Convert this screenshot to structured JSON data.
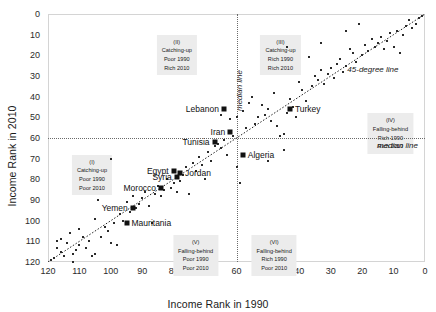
{
  "chart_data": {
    "type": "scatter",
    "title": "",
    "xlabel": "Income Rank in 1990",
    "ylabel": "Income Rank in 2010",
    "xlim": [
      120,
      0
    ],
    "ylim": [
      120,
      0
    ],
    "x_reversed": true,
    "y_reversed": true,
    "xticks": [
      120,
      110,
      100,
      90,
      80,
      70,
      60,
      50,
      40,
      30,
      20,
      10,
      0
    ],
    "yticks": [
      0,
      10,
      20,
      30,
      40,
      50,
      60,
      70,
      80,
      90,
      100,
      110,
      120
    ],
    "grid": false,
    "legend": "none",
    "reference_lines": [
      {
        "name": "45-degree line",
        "kind": "identity",
        "label": "45-degree line",
        "style": "dotted"
      },
      {
        "name": "median line vertical",
        "kind": "vertical",
        "value": 60,
        "label": "median line",
        "style": "dotted"
      },
      {
        "name": "median line horizontal",
        "kind": "horizontal",
        "value": 60,
        "label": "median line",
        "style": "dotted"
      }
    ],
    "quadrants": [
      {
        "id": "I",
        "roman": "(I)",
        "line1": "Catching-up",
        "line2": "Poor 1990",
        "line3": "Poor 2010",
        "x": 106,
        "y": 68
      },
      {
        "id": "II",
        "roman": "(II)",
        "line1": "Catching-up",
        "line2": "Poor 1990",
        "line3": "Rich 2010",
        "x": 79,
        "y": 10
      },
      {
        "id": "III",
        "roman": "(III)",
        "line1": "Catching-up",
        "line2": "Rich 1990",
        "line3": "Rich 2010",
        "x": 46,
        "y": 10
      },
      {
        "id": "IV",
        "roman": "(IV)",
        "line1": "Falling-behind",
        "line2": "Rich 1990",
        "line3": "Rich 2010",
        "x": 11,
        "y": 48
      },
      {
        "id": "V",
        "roman": "(V)",
        "line1": "Falling-behind",
        "line2": "Poor 1990",
        "line3": "Poor 2010",
        "x": 73,
        "y": 107
      },
      {
        "id": "VI",
        "roman": "(VI)",
        "line1": "Falling-behind",
        "line2": "Rich 1990",
        "line3": "Poor 2010",
        "x": 48,
        "y": 107
      }
    ],
    "highlighted": [
      {
        "name": "Lebanon",
        "x": 64,
        "y": 46,
        "label_side": "left"
      },
      {
        "name": "Turkey",
        "x": 43,
        "y": 46,
        "label_side": "right"
      },
      {
        "name": "Iran",
        "x": 62,
        "y": 57,
        "label_side": "left"
      },
      {
        "name": "Tunisia",
        "x": 67,
        "y": 62,
        "label_side": "left"
      },
      {
        "name": "Algeria",
        "x": 58,
        "y": 68,
        "label_side": "right"
      },
      {
        "name": "Egypt",
        "x": 80,
        "y": 76,
        "label_side": "left"
      },
      {
        "name": "Jordan",
        "x": 78,
        "y": 77,
        "label_side": "right"
      },
      {
        "name": "Syria",
        "x": 79,
        "y": 79,
        "label_side": "left"
      },
      {
        "name": "Morocco",
        "x": 84,
        "y": 84,
        "label_side": "left"
      },
      {
        "name": "Yemen",
        "x": 93,
        "y": 94,
        "label_side": "left"
      },
      {
        "name": "Mauritania",
        "x": 95,
        "y": 101,
        "label_side": "right"
      }
    ],
    "points": [
      [
        119,
        119
      ],
      [
        118,
        118
      ],
      [
        117,
        113
      ],
      [
        117,
        110
      ],
      [
        116,
        115
      ],
      [
        116,
        109
      ],
      [
        115,
        117
      ],
      [
        114,
        111
      ],
      [
        113,
        106
      ],
      [
        112,
        120
      ],
      [
        112,
        116
      ],
      [
        111,
        114
      ],
      [
        110,
        112
      ],
      [
        110,
        104
      ],
      [
        109,
        108
      ],
      [
        108,
        113
      ],
      [
        107,
        110
      ],
      [
        106,
        117
      ],
      [
        105,
        116
      ],
      [
        105,
        99
      ],
      [
        104,
        90
      ],
      [
        103,
        108
      ],
      [
        102,
        103
      ],
      [
        101,
        105
      ],
      [
        100,
        70
      ],
      [
        100,
        111
      ],
      [
        99,
        101
      ],
      [
        98,
        112
      ],
      [
        97,
        97
      ],
      [
        96,
        100
      ],
      [
        95,
        91
      ],
      [
        94,
        96
      ],
      [
        93,
        88
      ],
      [
        92,
        94
      ],
      [
        91,
        92
      ],
      [
        90,
        89
      ],
      [
        89,
        86
      ],
      [
        88,
        93
      ],
      [
        87,
        101
      ],
      [
        86,
        87
      ],
      [
        85,
        83
      ],
      [
        84,
        88
      ],
      [
        83,
        85
      ],
      [
        82,
        80
      ],
      [
        81,
        84
      ],
      [
        80,
        82
      ],
      [
        79,
        86
      ],
      [
        78,
        81
      ],
      [
        77,
        78
      ],
      [
        76,
        74
      ],
      [
        75,
        87
      ],
      [
        74,
        72
      ],
      [
        73,
        76
      ],
      [
        72,
        69
      ],
      [
        71,
        73
      ],
      [
        70,
        80
      ],
      [
        69,
        67
      ],
      [
        68,
        71
      ],
      [
        67,
        64
      ],
      [
        66,
        63
      ],
      [
        65,
        65
      ],
      [
        64,
        61
      ],
      [
        63,
        68
      ],
      [
        62,
        51
      ],
      [
        61,
        59
      ],
      [
        60,
        74
      ],
      [
        59,
        82
      ],
      [
        58,
        47
      ],
      [
        57,
        55
      ],
      [
        56,
        43
      ],
      [
        55,
        40
      ],
      [
        54,
        53
      ],
      [
        53,
        50
      ],
      [
        52,
        44
      ],
      [
        51,
        49
      ],
      [
        50,
        46
      ],
      [
        50,
        71
      ],
      [
        49,
        52
      ],
      [
        48,
        38
      ],
      [
        47,
        54
      ],
      [
        46,
        59
      ],
      [
        45,
        58
      ],
      [
        45,
        66
      ],
      [
        44,
        48
      ],
      [
        43,
        41
      ],
      [
        42,
        45
      ],
      [
        41,
        50
      ],
      [
        40,
        33
      ],
      [
        39,
        37
      ],
      [
        38,
        42
      ],
      [
        37,
        21
      ],
      [
        36,
        35
      ],
      [
        35,
        30
      ],
      [
        34,
        32
      ],
      [
        33,
        27
      ],
      [
        32,
        34
      ],
      [
        31,
        29
      ],
      [
        30,
        26
      ],
      [
        29,
        31
      ],
      [
        28,
        24
      ],
      [
        27,
        22
      ],
      [
        26,
        28
      ],
      [
        25,
        25
      ],
      [
        24,
        17
      ],
      [
        23,
        19
      ],
      [
        22,
        23
      ],
      [
        21,
        5
      ],
      [
        20,
        20
      ],
      [
        19,
        15
      ],
      [
        18,
        18
      ],
      [
        17,
        12
      ],
      [
        16,
        16
      ],
      [
        15,
        14
      ],
      [
        14,
        11
      ],
      [
        13,
        17
      ],
      [
        12,
        13
      ],
      [
        11,
        9
      ],
      [
        10,
        16
      ],
      [
        9,
        8
      ],
      [
        8,
        19
      ],
      [
        7,
        10
      ],
      [
        6,
        6
      ],
      [
        5,
        3
      ],
      [
        4,
        7
      ],
      [
        3,
        5
      ],
      [
        2,
        2
      ],
      [
        1,
        1
      ],
      [
        25,
        8
      ],
      [
        33,
        14
      ],
      [
        44,
        16
      ],
      [
        60,
        50
      ],
      [
        65,
        49
      ]
    ]
  }
}
